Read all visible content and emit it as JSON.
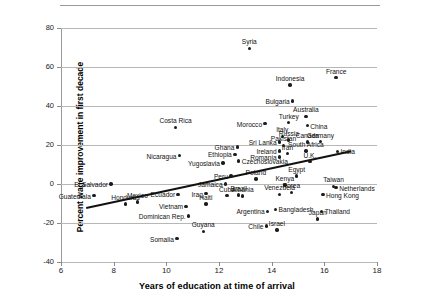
{
  "figure": {
    "has_top_rule": true,
    "background": "#ffffff"
  },
  "chart_data": {
    "type": "scatter",
    "title": "",
    "xlabel": "Years of education at time of arrival",
    "ylabel": "Percent wage improvement in first decade",
    "xlim": [
      6,
      18
    ],
    "ylim": [
      -40,
      80
    ],
    "xticks": [
      6,
      8,
      10,
      12,
      14,
      16,
      18
    ],
    "yticks": [
      80,
      60,
      40,
      20,
      0,
      -20,
      -40
    ],
    "grid": "horizontal",
    "legend": "none",
    "marker_color": "#1c1c1c",
    "trendline": {
      "visible": true,
      "color": "#111111",
      "x": [
        6.95,
        17.0
      ],
      "y": [
        -12.0,
        17.0
      ]
    },
    "points": [
      {
        "label": "Guatemala",
        "x": 7.25,
        "y": -6.0,
        "pos": "r"
      },
      {
        "label": "El Salvador",
        "x": 7.9,
        "y": 0.0,
        "pos": "r"
      },
      {
        "label": "Honduras",
        "x": 8.45,
        "y": -10.2,
        "pos": "c"
      },
      {
        "label": "Mexico",
        "x": 8.9,
        "y": -9.3,
        "pos": "c"
      },
      {
        "label": "Somalia",
        "x": 10.4,
        "y": -28.0,
        "pos": "r"
      },
      {
        "label": "Costa Rica",
        "x": 10.35,
        "y": 29.0,
        "pos": "c"
      },
      {
        "label": "Nicaragua",
        "x": 10.5,
        "y": 14.5,
        "pos": "r"
      },
      {
        "label": "Ecuador",
        "x": 10.45,
        "y": -5.3,
        "pos": "r"
      },
      {
        "label": "Vietnam",
        "x": 10.75,
        "y": -11.5,
        "pos": "r"
      },
      {
        "label": "Dominican Rep.",
        "x": 10.85,
        "y": -16.5,
        "pos": "r"
      },
      {
        "label": "Guyana",
        "x": 11.4,
        "y": -24.2,
        "pos": "c"
      },
      {
        "label": "Haiti",
        "x": 11.5,
        "y": -10.2,
        "pos": "c"
      },
      {
        "label": "Iraq",
        "x": 11.5,
        "y": -5.0,
        "pos": "r"
      },
      {
        "label": "Yugoslavia",
        "x": 12.15,
        "y": 10.8,
        "pos": "r"
      },
      {
        "label": "Jamaica",
        "x": 12.25,
        "y": 0.0,
        "pos": "r"
      },
      {
        "label": "Cuba",
        "x": 12.3,
        "y": -6.0,
        "pos": "c"
      },
      {
        "label": "Peru",
        "x": 12.45,
        "y": 4.2,
        "pos": "r"
      },
      {
        "label": "Ethiopia",
        "x": 12.6,
        "y": 15.2,
        "pos": "r"
      },
      {
        "label": "Ghana",
        "x": 12.7,
        "y": 19.0,
        "pos": "r"
      },
      {
        "label": "Czechoslovakia",
        "x": 12.75,
        "y": 11.7,
        "pos": "l"
      },
      {
        "label": "Brazil",
        "x": 12.75,
        "y": -5.7,
        "pos": "c"
      },
      {
        "label": "Albania",
        "x": 12.9,
        "y": -6.2,
        "pos": "c"
      },
      {
        "label": "Poland",
        "x": 13.4,
        "y": 2.5,
        "pos": "c"
      },
      {
        "label": "Chile",
        "x": 13.8,
        "y": -21.5,
        "pos": "r"
      },
      {
        "label": "Argentina",
        "x": 13.85,
        "y": -14.0,
        "pos": "r"
      },
      {
        "label": "Morocco",
        "x": 13.75,
        "y": 31.0,
        "pos": "r"
      },
      {
        "label": "Syria",
        "x": 13.15,
        "y": 69.5,
        "pos": "c"
      },
      {
        "label": "Romania",
        "x": 14.3,
        "y": 13.8,
        "pos": "r"
      },
      {
        "label": "Sri Lanka",
        "x": 14.3,
        "y": 21.5,
        "pos": "r"
      },
      {
        "label": "Ireland",
        "x": 14.3,
        "y": 17.0,
        "pos": "r"
      },
      {
        "label": "Italy",
        "x": 14.4,
        "y": 24.5,
        "pos": "c"
      },
      {
        "label": "Pakistan",
        "x": 14.45,
        "y": 19.8,
        "pos": "c"
      },
      {
        "label": "Venezuela",
        "x": 14.3,
        "y": -5.3,
        "pos": "c"
      },
      {
        "label": "Bangladesh",
        "x": 14.15,
        "y": -13.0,
        "pos": "l"
      },
      {
        "label": "Israel",
        "x": 14.2,
        "y": -23.5,
        "pos": "c"
      },
      {
        "label": "Kenya",
        "x": 14.5,
        "y": -0.5,
        "pos": "c"
      },
      {
        "label": "Iran",
        "x": 14.6,
        "y": 15.5,
        "pos": "c"
      },
      {
        "label": "Russia",
        "x": 14.65,
        "y": 22.5,
        "pos": "c"
      },
      {
        "label": "Turkey",
        "x": 14.65,
        "y": 31.5,
        "pos": "c"
      },
      {
        "label": "Bulgaria",
        "x": 14.8,
        "y": 42.5,
        "pos": "r"
      },
      {
        "label": "Indonesia",
        "x": 14.7,
        "y": 50.8,
        "pos": "c"
      },
      {
        "label": "Korea",
        "x": 14.75,
        "y": -4.2,
        "pos": "c"
      },
      {
        "label": "Japan",
        "x": 15.75,
        "y": -18.0,
        "pos": "c"
      },
      {
        "label": "Egypt",
        "x": 14.95,
        "y": 4.2,
        "pos": "c"
      },
      {
        "label": "Canada",
        "x": 15.35,
        "y": 21.5,
        "pos": "c"
      },
      {
        "label": "South Africa",
        "x": 15.3,
        "y": 17.0,
        "pos": "c"
      },
      {
        "label": "Australia",
        "x": 15.3,
        "y": 34.7,
        "pos": "c"
      },
      {
        "label": "China",
        "x": 15.35,
        "y": 30.0,
        "pos": "l"
      },
      {
        "label": "Germany",
        "x": 15.85,
        "y": 21.7,
        "pos": "c"
      },
      {
        "label": "Hong Kong",
        "x": 15.95,
        "y": -5.5,
        "pos": "l"
      },
      {
        "label": "Thailand",
        "x": 15.9,
        "y": -14.0,
        "pos": "l"
      },
      {
        "label": "Taiwan",
        "x": 16.35,
        "y": -1.2,
        "pos": "c"
      },
      {
        "label": "Netherlands",
        "x": 16.45,
        "y": -1.8,
        "pos": "l"
      },
      {
        "label": "France",
        "x": 16.45,
        "y": 54.5,
        "pos": "c"
      },
      {
        "label": "India",
        "x": 16.5,
        "y": 16.8,
        "pos": "l"
      },
      {
        "label": "U.K.",
        "x": 15.45,
        "y": 11.5,
        "pos": "c"
      }
    ]
  }
}
